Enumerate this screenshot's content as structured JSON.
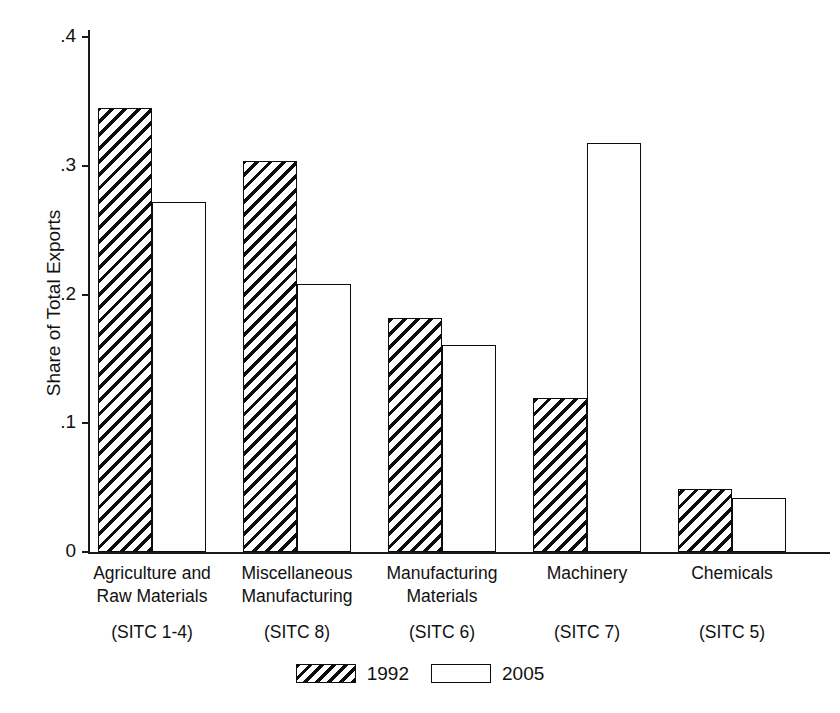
{
  "chart_data": {
    "type": "bar",
    "title": "",
    "subtitle": "",
    "xlabel": "",
    "ylabel": "Share of Total Exports",
    "ylim": [
      0,
      0.4
    ],
    "yticks": [
      "0",
      ".1",
      ".2",
      ".3",
      ".4"
    ],
    "ytick_values": [
      0,
      0.1,
      0.2,
      0.3,
      0.4
    ],
    "grid": false,
    "legend_position": "bottom",
    "categories": [
      "Agriculture and Raw Materials (SITC 1-4)",
      "Miscellaneous Manufacturing (SITC 8)",
      "Manufacturing Materials (SITC 6)",
      "Machinery (SITC 7)",
      "Chemicals (SITC 5)"
    ],
    "category_labels": [
      {
        "line1": "Agriculture and",
        "line2": "Raw Materials",
        "code": "(SITC 1-4)"
      },
      {
        "line1": "Miscellaneous",
        "line2": "Manufacturing",
        "code": "(SITC 8)"
      },
      {
        "line1": "Manufacturing",
        "line2": "Materials",
        "code": "(SITC 6)"
      },
      {
        "line1": "Machinery",
        "line2": "",
        "code": "(SITC 7)"
      },
      {
        "line1": "Chemicals",
        "line2": "",
        "code": "(SITC 5)"
      }
    ],
    "series": [
      {
        "name": "1992",
        "fill": "hatched",
        "values": [
          0.345,
          0.304,
          0.182,
          0.12,
          0.049
        ]
      },
      {
        "name": "2005",
        "fill": "white",
        "values": [
          0.272,
          0.208,
          0.161,
          0.318,
          0.042
        ]
      }
    ]
  },
  "legend": {
    "entries": [
      {
        "label": "1992",
        "fill": "hatched"
      },
      {
        "label": "2005",
        "fill": "white"
      }
    ]
  },
  "colors": {
    "ink": "#0d0d0d",
    "background": "#ffffff"
  }
}
